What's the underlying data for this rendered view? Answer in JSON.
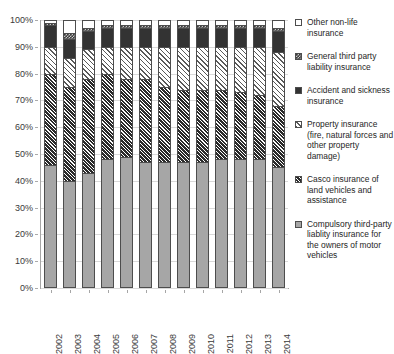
{
  "chart_data": {
    "type": "bar",
    "subtype": "stacked-percentage",
    "title": "",
    "xlabel": "",
    "ylabel": "",
    "ylim": [
      0,
      100
    ],
    "ytick_labels": [
      "0%",
      "10%",
      "20%",
      "30%",
      "40%",
      "50%",
      "60%",
      "70%",
      "80%",
      "90%",
      "100%"
    ],
    "ytick_values": [
      0,
      10,
      20,
      30,
      40,
      50,
      60,
      70,
      80,
      90,
      100
    ],
    "grid": true,
    "legend_position": "right",
    "categories": [
      "2002",
      "2003",
      "2004",
      "2005",
      "2006",
      "2007",
      "2008",
      "2009",
      "2010",
      "2011",
      "2012",
      "2013",
      "2014"
    ],
    "series": [
      {
        "name": "Compulsory third-party liablity insurance for the owners of motor vehicles",
        "pattern": "solid-gray",
        "values": [
          46,
          40,
          43,
          48,
          49,
          47,
          47,
          47,
          47,
          48,
          48,
          48,
          45
        ]
      },
      {
        "name": "Casco insurance of land vehicles and assistance",
        "pattern": "dense-dark-hatch",
        "values": [
          34,
          35,
          35,
          32,
          29,
          31,
          28,
          27,
          27,
          26,
          25,
          24,
          23
        ]
      },
      {
        "name": "Property insurance (fire, natural forces and other property damage)",
        "pattern": "light-diagonal-hatch",
        "values": [
          10,
          11,
          11,
          10,
          12,
          12,
          15,
          16,
          16,
          16,
          17,
          18,
          20
        ]
      },
      {
        "name": "Accident and sickness insurance",
        "pattern": "solid-dark",
        "values": [
          8,
          7,
          7,
          7,
          7,
          7,
          7,
          7,
          7,
          7,
          7,
          7,
          8
        ]
      },
      {
        "name": "General third party liability insurance",
        "pattern": "checker",
        "values": [
          1,
          2,
          1,
          1,
          1,
          1,
          1,
          1,
          1,
          1,
          1,
          1,
          1
        ]
      },
      {
        "name": "Other non-life insurance",
        "pattern": "white",
        "values": [
          1,
          5,
          3,
          2,
          2,
          2,
          2,
          2,
          2,
          2,
          2,
          2,
          3
        ]
      }
    ]
  },
  "legend": {
    "items": [
      {
        "label": "Other non-life insurance",
        "pattern": "white"
      },
      {
        "label": "General third party liability insurance",
        "pattern": "checker"
      },
      {
        "label": "Accident and sickness insurance",
        "pattern": "solid-dark"
      },
      {
        "label": "Property insurance (fire, natural forces and other property damage)",
        "pattern": "light-diagonal-hatch"
      },
      {
        "label": "Casco insurance of land vehicles and assistance",
        "pattern": "dense-dark-hatch"
      },
      {
        "label": "Compulsory third-party liablity insurance for the owners of motor vehicles",
        "pattern": "solid-gray"
      }
    ]
  },
  "colors": {
    "grid": "#d9d9d9",
    "axis": "#a6a6a6",
    "text": "#262626",
    "solid_gray": "#a6a6a6",
    "solid_dark": "#333333",
    "white": "#ffffff"
  }
}
